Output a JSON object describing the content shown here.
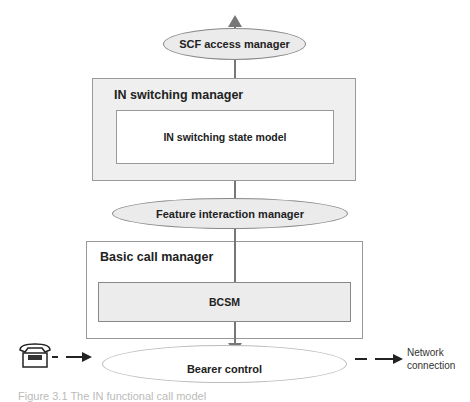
{
  "diagram": {
    "top_arrow": {
      "direction": "up"
    },
    "scf_access_manager": {
      "label": "SCF access manager"
    },
    "in_switching_manager": {
      "label": "IN switching manager",
      "inner": {
        "label": "IN switching state model"
      }
    },
    "feature_interaction_manager": {
      "label": "Feature interaction manager"
    },
    "basic_call_manager": {
      "label": "Basic call manager",
      "inner": {
        "label": "BCSM"
      }
    },
    "bearer_control": {
      "label": "Bearer control"
    },
    "telephone": {
      "icon": "telephone-icon"
    },
    "network_connection": {
      "line1": "Network",
      "line2": "connection"
    },
    "caption": "Figure 3.1  The IN functional call model"
  },
  "colors": {
    "line": "#777777",
    "grey_fill": "#ebebeb",
    "box_border": "#999999"
  }
}
